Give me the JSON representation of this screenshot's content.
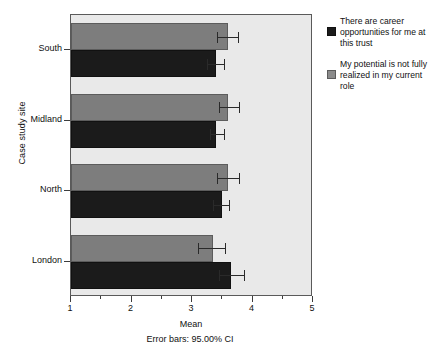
{
  "chart_data": {
    "type": "bar",
    "orientation": "horizontal",
    "title": "",
    "xlabel": "Mean",
    "ylabel": "Case study site",
    "caption": "Error bars: 95.00% CI",
    "xlim": [
      1,
      5
    ],
    "xticks": [
      1,
      2,
      3,
      4,
      5
    ],
    "xtick_labels": [
      "1",
      "2",
      "3",
      "4",
      "5"
    ],
    "minor_ticks": [
      1.5,
      2.5,
      3.5,
      4.5
    ],
    "grid": false,
    "legend_position": "right",
    "categories": [
      "South",
      "Midland",
      "North",
      "London"
    ],
    "series": [
      {
        "name": "There are career opportunities for me at this trust",
        "color": "#1b1b1b",
        "values": [
          3.4,
          3.4,
          3.5,
          3.65
        ],
        "ci_low": [
          3.25,
          3.3,
          3.35,
          3.45
        ],
        "ci_high": [
          3.55,
          3.55,
          3.62,
          3.87
        ]
      },
      {
        "name": "My potential is not fully realized in my current role",
        "color": "#7d7d7d",
        "values": [
          3.6,
          3.6,
          3.6,
          3.35
        ],
        "ci_low": [
          3.42,
          3.44,
          3.42,
          3.1
        ],
        "ci_high": [
          3.78,
          3.8,
          3.79,
          3.57
        ]
      }
    ]
  },
  "axes": {
    "y_title": "Case study site",
    "x_title": "Mean",
    "caption": "Error bars: 95.00% CI",
    "y_labels": [
      "South",
      "Midland",
      "North",
      "London"
    ],
    "x_labels": [
      "1",
      "2",
      "3",
      "4",
      "5"
    ]
  },
  "legend": {
    "entries": [
      {
        "label": "There are career opportunities for me at this trust",
        "swatch": "black-swatch"
      },
      {
        "label": "My potential is not fully realized in my current role",
        "swatch": "gray-swatch"
      }
    ]
  },
  "colors": {
    "series_black": "#1b1b1b",
    "series_gray": "#7d7d7d",
    "plot_background": "#e9e9e9",
    "frame": "#5a5a5a",
    "page_background": "#ffffff"
  }
}
